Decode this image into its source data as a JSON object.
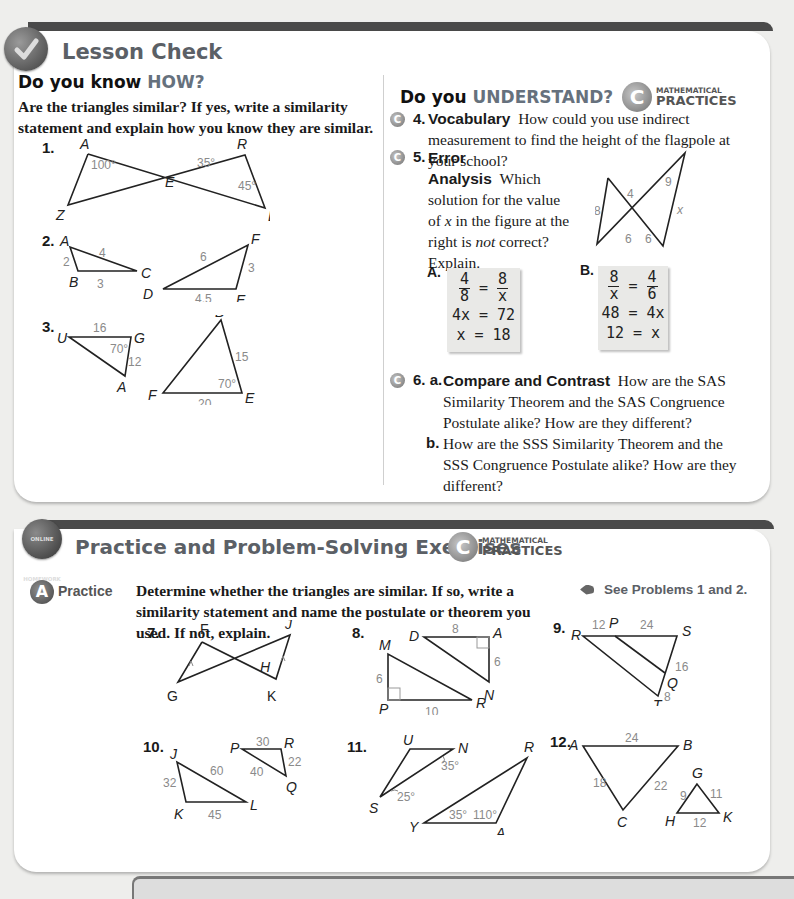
{
  "lesson_check": {
    "title": "Lesson Check",
    "icon": "checkmark-icon",
    "how": {
      "heading_prefix": "Do you know ",
      "heading_accent": "HOW?",
      "instructions": "Are the triangles similar? If yes, write a similarity statement and explain how you know they are similar.",
      "problems": [
        {
          "number": "1.",
          "labels": [
            "A",
            "R",
            "E",
            "Z",
            "B"
          ],
          "measures": [
            "100°",
            "35°",
            "45°"
          ]
        },
        {
          "number": "2.",
          "labels": [
            "A",
            "B",
            "C",
            "F",
            "D",
            "E"
          ],
          "measures": [
            "2",
            "4",
            "3",
            "6",
            "3",
            "4.5"
          ]
        },
        {
          "number": "3.",
          "labels": [
            "U",
            "G",
            "A",
            "B",
            "F",
            "E"
          ],
          "measures": [
            "16",
            "70°",
            "12",
            "15",
            "70°",
            "20"
          ]
        }
      ]
    },
    "understand": {
      "heading_prefix": "Do you ",
      "heading_accent": "UNDERSTAND?",
      "mp_small": "MATHEMATICAL",
      "mp_large": "PRACTICES",
      "q4": {
        "number": "4.",
        "title": "Vocabulary",
        "text": "How could you use indirect measurement to find the height of the flagpole at your school?"
      },
      "q5": {
        "number": "5.",
        "title": "Error Analysis",
        "text_1": "Which solution for the value of",
        "var": "x",
        "text_2": " in the figure at the right is ",
        "emph": "not",
        "text_3": " correct? Explain.",
        "figure_measures": [
          "9",
          "4",
          "8",
          "x",
          "6",
          "6"
        ],
        "solution_a": {
          "label": "A.",
          "frac_l": [
            "4",
            "8"
          ],
          "frac_r": [
            "8",
            "x"
          ],
          "line2": "4x = 72",
          "line3": "x = 18"
        },
        "solution_b": {
          "label": "B.",
          "frac_l": [
            "8",
            "x"
          ],
          "frac_r": [
            "4",
            "6"
          ],
          "line2": "48 = 4x",
          "line3": "12 = x"
        }
      },
      "q6": {
        "number": "6.",
        "a_label": "a.",
        "a_title": "Compare and Contrast",
        "a_text": "How are the SAS Similarity Theorem and the SAS Congruence Postulate alike? How are they different?",
        "b_label": "b.",
        "b_text": "How are the SSS Similarity Theorem and the SSS Congruence Postulate alike? How are they different?"
      }
    }
  },
  "practice": {
    "title": "Practice and Problem-Solving Exercises",
    "online_badge": "ONLINE HOMEWORK",
    "mp_small": "MATHEMATICAL",
    "mp_large": "PRACTICES",
    "level_letter": "A",
    "level_label": "Practice",
    "instructions": "Determine whether the triangles are similar. If so, write a similarity statement and name the postulate or theorem you used. If not, explain.",
    "see_problems": "See Problems 1 and 2.",
    "problems": [
      {
        "number": "7.",
        "labels": [
          "F",
          "J",
          "H",
          "G",
          "K"
        ]
      },
      {
        "number": "8.",
        "labels": [
          "D",
          "A",
          "M",
          "N",
          "P",
          "R"
        ],
        "measures": [
          "8",
          "6",
          "6",
          "10"
        ]
      },
      {
        "number": "9.",
        "labels": [
          "R",
          "P",
          "S",
          "Q",
          "T"
        ],
        "measures": [
          "12",
          "24",
          "16",
          "8"
        ]
      },
      {
        "number": "10.",
        "labels": [
          "J",
          "K",
          "L",
          "P",
          "R",
          "Q"
        ],
        "measures": [
          "32",
          "60",
          "45",
          "30",
          "40",
          "22"
        ]
      },
      {
        "number": "11.",
        "labels": [
          "U",
          "N",
          "S",
          "R",
          "Y",
          "A"
        ],
        "measures": [
          "35°",
          "25°",
          "35°",
          "110°"
        ]
      },
      {
        "number": "12.",
        "labels": [
          "A",
          "B",
          "C",
          "G",
          "H",
          "K"
        ],
        "measures": [
          "24",
          "18",
          "22",
          "9",
          "11",
          "12"
        ]
      }
    ]
  }
}
